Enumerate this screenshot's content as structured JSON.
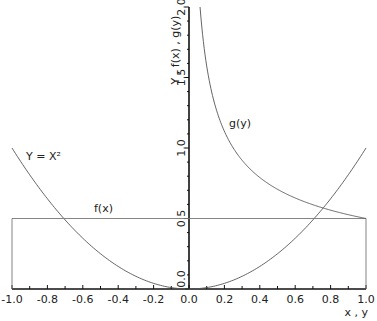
{
  "chart_data": {
    "type": "line",
    "title": "",
    "xlabel": "x , y",
    "ylabel": "Y , f(x) , g(y)",
    "xlim": [
      -1.0,
      1.0
    ],
    "ylim": [
      0.0,
      2.0
    ],
    "grid": false,
    "x_ticks": [
      "-1.0",
      "-0.8",
      "-0.6",
      "-0.4",
      "-0.2",
      "0.0",
      "0.2",
      "0.4",
      "0.6",
      "0.8",
      "1.0"
    ],
    "x_tick_values": [
      -1.0,
      -0.8,
      -0.6,
      -0.4,
      -0.2,
      0.0,
      0.2,
      0.4,
      0.6,
      0.8,
      1.0
    ],
    "y_ticks": [
      "0.0",
      "0.5",
      "1.0",
      "1.5",
      "2.0"
    ],
    "y_tick_values": [
      0.0,
      0.5,
      1.0,
      1.5,
      2.0
    ],
    "series": [
      {
        "name": "Y = X²",
        "formula": "y = x^2",
        "domain": [
          -1.0,
          1.0
        ],
        "x": [
          -1.0,
          -0.8,
          -0.6,
          -0.4,
          -0.2,
          0.0,
          0.2,
          0.4,
          0.6,
          0.8,
          1.0
        ],
        "y": [
          1.0,
          0.64,
          0.36,
          0.16,
          0.04,
          0.0,
          0.04,
          0.16,
          0.36,
          0.64,
          1.0
        ]
      },
      {
        "name": "f(x)",
        "formula": "f(x) = 0.5 on [-1, 1]",
        "domain": [
          -1.0,
          1.0
        ],
        "x": [
          -1.0,
          -1.0,
          1.0,
          1.0
        ],
        "y": [
          0.0,
          0.5,
          0.5,
          0.0
        ]
      },
      {
        "name": "g(y)",
        "formula": "g(y) = 1 / (2 sqrt(y))",
        "domain": [
          0.0625,
          1.0
        ],
        "x": [
          0.0625,
          0.1,
          0.2,
          0.3,
          0.4,
          0.5,
          0.6,
          0.7,
          0.8,
          0.9,
          1.0
        ],
        "y": [
          2.0,
          1.581,
          1.118,
          0.913,
          0.791,
          0.707,
          0.645,
          0.598,
          0.559,
          0.527,
          0.5
        ]
      }
    ],
    "annotations": [
      {
        "text": "Y = X²",
        "near": "left parabola branch, y≈0.95"
      },
      {
        "text": "f(x)",
        "near": "above f(x) line, x≈-0.5"
      },
      {
        "text": "g(y)",
        "near": "right of g(y) curve, y≈1.2"
      }
    ]
  }
}
